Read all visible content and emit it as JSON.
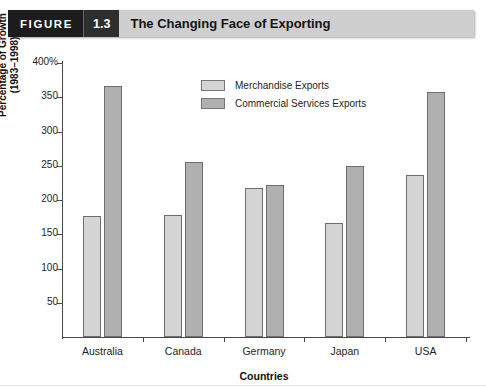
{
  "header": {
    "figure_word": "FIGURE",
    "figure_number": "1.3",
    "title": "The Changing Face of Exporting"
  },
  "legend": {
    "position": "inside-top-center",
    "items": [
      {
        "label": "Merchandise Exports",
        "color": "#d4d4d4",
        "swatch_name": "legend-swatch-merchandise"
      },
      {
        "label": "Commercial Services Exports",
        "color": "#b0b0b0",
        "swatch_name": "legend-swatch-commercial-services"
      }
    ]
  },
  "axis": {
    "y_title_line1": "Percentage of Growth",
    "y_title_line2": "(1983–1998)",
    "x_title": "Countries",
    "y_ticks": [
      "400%",
      "350",
      "300",
      "250",
      "200",
      "150",
      "100",
      "50"
    ]
  },
  "chart_data": {
    "type": "bar",
    "title": "The Changing Face of Exporting",
    "xlabel": "Countries",
    "ylabel": "Percentage of Growth (1983–1998)",
    "categories": [
      "Australia",
      "Canada",
      "Germany",
      "Japan",
      "USA"
    ],
    "series": [
      {
        "name": "Merchandise Exports",
        "color": "#d4d4d4",
        "values": [
          177,
          178,
          218,
          167,
          237
        ]
      },
      {
        "name": "Commercial Services Exports",
        "color": "#b0b0b0",
        "values": [
          366,
          255,
          222,
          250,
          358
        ]
      }
    ],
    "ylim": [
      0,
      400
    ],
    "ytick_values": [
      400,
      350,
      300,
      250,
      200,
      150,
      100,
      50
    ],
    "y_unit": "%",
    "grid": false,
    "legend_position": "inside-top-center"
  }
}
